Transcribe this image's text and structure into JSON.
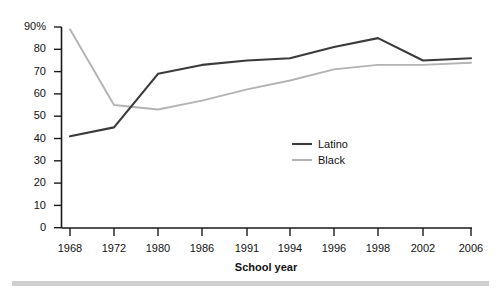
{
  "chart_data": {
    "type": "line",
    "title": "",
    "xlabel": "School year",
    "ylabel": "",
    "categories": [
      "1968",
      "1972",
      "1980",
      "1986",
      "1991",
      "1994",
      "1996",
      "1998",
      "2002",
      "2006"
    ],
    "x": [
      1968,
      1972,
      1980,
      1986,
      1991,
      1994,
      1996,
      1998,
      2002,
      2006
    ],
    "ylim": [
      0,
      90
    ],
    "yticks": [
      0,
      10,
      20,
      30,
      40,
      50,
      60,
      70,
      80,
      90
    ],
    "ytick_labels": [
      "0",
      "10",
      "20",
      "30",
      "40",
      "50",
      "60",
      "70",
      "80",
      "90%"
    ],
    "grid": false,
    "legend_position": "center",
    "series": [
      {
        "name": "Latino",
        "color": "#3a3a3a",
        "values": [
          41,
          45,
          69,
          73,
          75,
          76,
          81,
          85,
          75,
          76
        ]
      },
      {
        "name": "Black",
        "color": "#b3b3b3",
        "values": [
          89,
          55,
          53,
          57,
          62,
          66,
          71,
          73,
          73,
          74
        ]
      }
    ]
  },
  "axes": {
    "y_ticks": [
      {
        "label": "90%",
        "value": 90
      },
      {
        "label": "80",
        "value": 80
      },
      {
        "label": "70",
        "value": 70
      },
      {
        "label": "60",
        "value": 60
      },
      {
        "label": "50",
        "value": 50
      },
      {
        "label": "40",
        "value": 40
      },
      {
        "label": "30",
        "value": 30
      },
      {
        "label": "20",
        "value": 20
      },
      {
        "label": "10",
        "value": 10
      },
      {
        "label": "0",
        "value": 0
      }
    ],
    "x_ticks": [
      {
        "label": "1968"
      },
      {
        "label": "1972"
      },
      {
        "label": "1980"
      },
      {
        "label": "1986"
      },
      {
        "label": "1991"
      },
      {
        "label": "1994"
      },
      {
        "label": "1996"
      },
      {
        "label": "1998"
      },
      {
        "label": "2002"
      },
      {
        "label": "2006"
      }
    ],
    "x_axis_title": "School year"
  },
  "legend": {
    "items": [
      {
        "label": "Latino",
        "color": "#3a3a3a"
      },
      {
        "label": "Black",
        "color": "#b3b3b3"
      }
    ]
  },
  "colors": {
    "axis": "#1a1a1a",
    "latino_line": "#3a3a3a",
    "black_line": "#b3b3b3",
    "text": "#111111",
    "footer_rule": "#cfcfcf"
  }
}
